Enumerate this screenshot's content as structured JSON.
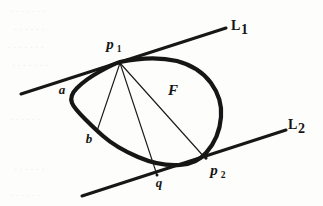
{
  "figure": {
    "caption_type": "geometric-diagram",
    "background_color": "#fdfdfb",
    "ink_color": "#161616"
  },
  "labels": {
    "line1": {
      "text": "L",
      "subscript": "1",
      "x": 233,
      "y": 27
    },
    "line2": {
      "text": "L",
      "subscript": "2",
      "x": 288,
      "y": 126
    },
    "point_p1": {
      "text": "p",
      "subscript": "1",
      "x": 112,
      "y": 46
    },
    "point_p2": {
      "text": "p",
      "subscript": "2",
      "x": 217,
      "y": 172
    },
    "point_a": {
      "text": "a",
      "x": 62,
      "y": 91
    },
    "point_b": {
      "text": "b",
      "x": 89,
      "y": 140
    },
    "point_q": {
      "text": "q",
      "x": 159,
      "y": 184
    },
    "region_F": {
      "text": "F",
      "x": 173,
      "y": 92
    }
  },
  "geometry": {
    "line_L1": {
      "x1": 21,
      "y1": 94,
      "x2": 226,
      "y2": 28
    },
    "line_L2": {
      "x1": 82,
      "y1": 196,
      "x2": 286,
      "y2": 130
    },
    "blob_path": "M 120 62 C 148 58 178 58 198 70 C 216 81 224 100 222 118 C 221 134 214 148 205 157 C 196 165 183 166 168 164 C 148 161 126 153 110 141 C 95 130 82 120 75 110 C 69 101 70 92 78 84 C 88 74 104 66 120 62 Z",
    "chord_p1_b": {
      "x1": 120,
      "y1": 63,
      "x2": 97,
      "y2": 131
    },
    "chord_p1_q": {
      "x1": 120,
      "y1": 63,
      "x2": 157,
      "y2": 175
    },
    "chord_p1_p2": {
      "x1": 120,
      "y1": 63,
      "x2": 206,
      "y2": 159
    },
    "point_p1_coord": {
      "x": 120,
      "y": 62
    },
    "point_p2_coord": {
      "x": 206,
      "y": 158
    },
    "point_q_coord": {
      "x": 157,
      "y": 175
    }
  }
}
